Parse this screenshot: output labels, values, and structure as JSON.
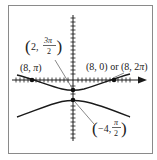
{
  "diagram": {
    "type": "polar-conic-graph",
    "colors": {
      "curve": "#1a1a1a",
      "axis": "#1a1a1a",
      "frame": "#8a8a8a",
      "leader": "#555555",
      "text": "#222222"
    },
    "points": [
      {
        "id": "p-8-pi",
        "label": "(8, π)",
        "label_parts": {
          "open": "(8, ",
          "var": "π",
          "close": ")"
        }
      },
      {
        "id": "p-8-0",
        "label": "(8, 0) or (8, 2π)",
        "label_parts": {
          "a": "(8, 0) or (8, 2",
          "var": "π",
          "close": ")"
        }
      },
      {
        "id": "p-2-3pi2",
        "label": "(2, 3π/2)",
        "label_parts": {
          "open": "(",
          "r": "2,",
          "num": "3π",
          "den": "2",
          "close": ")"
        }
      },
      {
        "id": "p-neg4-pi2",
        "label": "(−4, π/2)",
        "label_parts": {
          "open": "(",
          "r": "−4,",
          "num": "π",
          "den": "2",
          "close": ")"
        }
      }
    ],
    "branches": [
      "upper-branch",
      "lower-branch"
    ],
    "axes": {
      "x_arrow": true,
      "ticks": true
    }
  }
}
